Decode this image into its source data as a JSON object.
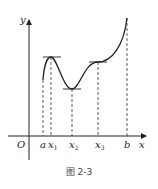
{
  "figure": {
    "caption": "图 2-3",
    "axes": {
      "x_label": "x",
      "y_label": "y",
      "origin_label": "O"
    },
    "points": [
      {
        "label": "a",
        "role": "left endpoint"
      },
      {
        "label": "x",
        "subscript": "1",
        "role": "local maximum"
      },
      {
        "label": "x",
        "subscript": "2",
        "role": "local minimum"
      },
      {
        "label": "x",
        "subscript": "3",
        "role": "horizontal tangent / inflection"
      },
      {
        "label": "b",
        "role": "right endpoint"
      }
    ]
  }
}
